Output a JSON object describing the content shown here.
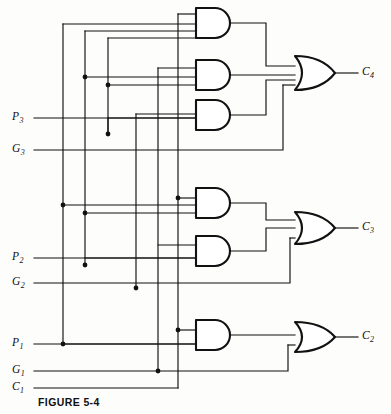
{
  "figure": {
    "caption": "FIGURE 5-4",
    "background_color": "#fdfdfb",
    "line_color": "#111111"
  },
  "inputs": [
    {
      "id": "p3",
      "base": "P",
      "sub": "3",
      "label": "P3",
      "x": 12,
      "y": 118
    },
    {
      "id": "g3",
      "base": "G",
      "sub": "3",
      "label": "G3",
      "x": 12,
      "y": 150
    },
    {
      "id": "p2",
      "base": "P",
      "sub": "2",
      "label": "P2",
      "x": 12,
      "y": 258
    },
    {
      "id": "g2",
      "base": "G",
      "sub": "2",
      "label": "G2",
      "x": 12,
      "y": 283
    },
    {
      "id": "p1",
      "base": "P",
      "sub": "1",
      "label": "P1",
      "x": 12,
      "y": 334
    },
    {
      "id": "g1",
      "base": "G",
      "sub": "1",
      "label": "G1",
      "x": 12,
      "y": 363
    },
    {
      "id": "c1",
      "base": "C",
      "sub": "1",
      "label": "C1",
      "x": 12,
      "y": 388
    }
  ],
  "outputs": [
    {
      "id": "c4",
      "base": "C",
      "sub": "4",
      "label": "C4",
      "x": 362,
      "y": 73
    },
    {
      "id": "c3",
      "base": "C",
      "sub": "3",
      "label": "C3",
      "x": 362,
      "y": 228
    },
    {
      "id": "c2",
      "base": "C",
      "sub": "2",
      "label": "C2",
      "x": 362,
      "y": 337
    }
  ],
  "and_gates": [
    {
      "id": "and-gate-1",
      "inputs": 4,
      "x": 196,
      "y": 8,
      "w": 38,
      "h": 30
    },
    {
      "id": "and-gate-2",
      "inputs": 3,
      "x": 196,
      "y": 60,
      "w": 38,
      "h": 30
    },
    {
      "id": "and-gate-3",
      "inputs": 2,
      "x": 196,
      "y": 100,
      "w": 38,
      "h": 30
    },
    {
      "id": "and-gate-4",
      "inputs": 3,
      "x": 196,
      "y": 188,
      "w": 38,
      "h": 30
    },
    {
      "id": "and-gate-5",
      "inputs": 2,
      "x": 196,
      "y": 236,
      "w": 38,
      "h": 30
    },
    {
      "id": "and-gate-6",
      "inputs": 2,
      "x": 196,
      "y": 320,
      "w": 38,
      "h": 30
    }
  ],
  "or_gates": [
    {
      "id": "or-gate-c4",
      "inputs": 4,
      "x": 295,
      "y": 58,
      "w": 40,
      "h": 34,
      "output": "C4"
    },
    {
      "id": "or-gate-c3",
      "inputs": 3,
      "x": 295,
      "y": 212,
      "w": 40,
      "h": 32,
      "output": "C3"
    },
    {
      "id": "or-gate-c2",
      "inputs": 2,
      "x": 295,
      "y": 322,
      "w": 40,
      "h": 30,
      "output": "C2"
    }
  ],
  "vertical_buses": [
    {
      "id": "bus-p1",
      "x": 63
    },
    {
      "id": "bus-p2",
      "x": 85
    },
    {
      "id": "bus-p3",
      "x": 108
    },
    {
      "id": "bus-g2",
      "x": 136
    },
    {
      "id": "bus-g1",
      "x": 158
    },
    {
      "id": "bus-c1",
      "x": 178
    }
  ],
  "junction_dots": [
    {
      "x": 85,
      "y": 77
    },
    {
      "x": 108,
      "y": 85
    },
    {
      "x": 108,
      "y": 134
    },
    {
      "x": 63,
      "y": 205
    },
    {
      "x": 85,
      "y": 213
    },
    {
      "x": 178,
      "y": 198
    },
    {
      "x": 85,
      "y": 265
    },
    {
      "x": 136,
      "y": 288
    },
    {
      "x": 63,
      "y": 344
    },
    {
      "x": 178,
      "y": 330
    },
    {
      "x": 158,
      "y": 371
    }
  ]
}
